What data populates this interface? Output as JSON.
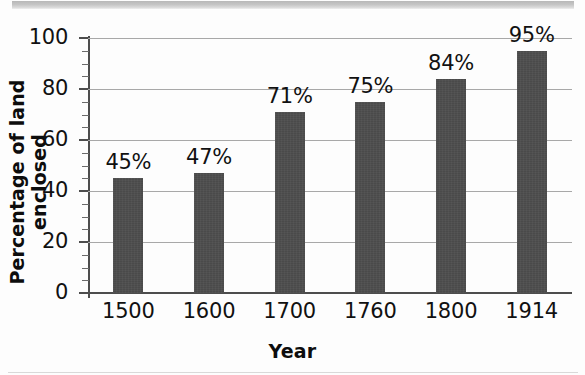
{
  "chart_data": {
    "type": "bar",
    "title": "",
    "categories": [
      "1500",
      "1600",
      "1700",
      "1760",
      "1800",
      "1914"
    ],
    "values": [
      45,
      47,
      71,
      75,
      84,
      95
    ],
    "data_labels": [
      "45%",
      "47%",
      "71%",
      "75%",
      "84%",
      "95%"
    ],
    "xlabel": "Year",
    "ylabel": "Percentage of land enclosed",
    "ylim": [
      0,
      100
    ],
    "y_ticks": [
      0,
      20,
      40,
      60,
      80,
      100
    ],
    "y_tick_labels": [
      "0",
      "20",
      "40",
      "60",
      "80",
      "100"
    ],
    "y_minor_tick_interval": 5,
    "grid": true,
    "grid_axis": "y",
    "legend": null,
    "colors": {
      "bar": "#4a4a4a",
      "gridline": "#a8a8a8",
      "axis": "#4d4d4d",
      "text": "#111111",
      "background": "#fdfdfd"
    }
  }
}
